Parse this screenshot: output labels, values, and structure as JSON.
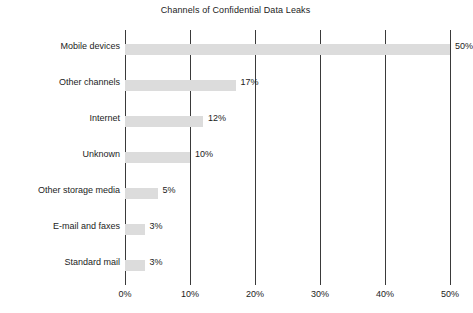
{
  "chart_data": {
    "type": "bar",
    "orientation": "horizontal",
    "title": "Channels of Confidential Data Leaks",
    "xlabel": "",
    "ylabel": "",
    "xlim": [
      0,
      50
    ],
    "grid": "vertical",
    "legend": "none",
    "categories": [
      "Mobile devices",
      "Other channels",
      "Internet",
      "Unknown",
      "Other storage media",
      "E-mail and faxes",
      "Standard mail"
    ],
    "values": [
      50,
      17,
      12,
      10,
      5,
      3,
      3
    ],
    "value_labels": [
      "50%",
      "17%",
      "12%",
      "10%",
      "5%",
      "3%",
      "3%"
    ],
    "xticks": [
      0,
      10,
      20,
      30,
      40,
      50
    ],
    "xtick_labels": [
      "0%",
      "10%",
      "20%",
      "30%",
      "40%",
      "50%"
    ],
    "bar_color": "#dcdcdc",
    "gridline_color": "#3a3a3a",
    "background_color": "#ffffff",
    "text_color": "#1c1c1c"
  }
}
